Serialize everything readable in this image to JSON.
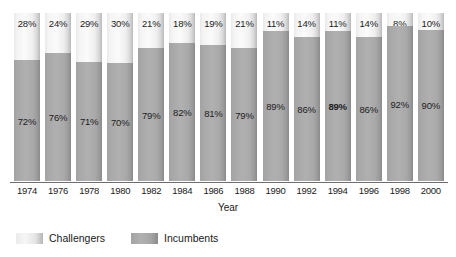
{
  "chart_data": {
    "type": "bar",
    "stacked": true,
    "stack_mode": "percent",
    "title": "",
    "subtitle": "",
    "xlabel": "Year",
    "ylabel": "",
    "ylim": [
      0,
      100
    ],
    "grid": false,
    "legend_position": "bottom-left",
    "categories": [
      "1974",
      "1976",
      "1978",
      "1980",
      "1982",
      "1984",
      "1986",
      "1988",
      "1990",
      "1992",
      "1994",
      "1996",
      "1998",
      "2000"
    ],
    "series": [
      {
        "name": "Challengers",
        "color": "#f2f2f2",
        "values": [
          28,
          24,
          29,
          30,
          21,
          18,
          19,
          21,
          11,
          14,
          11,
          14,
          8,
          10
        ],
        "labels": [
          "28%",
          "24%",
          "29%",
          "30%",
          "21%",
          "18%",
          "19%",
          "21%",
          "11%",
          "14%",
          "11%",
          "14%",
          "8%",
          "10%"
        ]
      },
      {
        "name": "Incumbents",
        "color": "#ababab",
        "values": [
          72,
          76,
          71,
          70,
          79,
          82,
          81,
          79,
          89,
          86,
          89,
          86,
          92,
          90
        ],
        "labels": [
          "72%",
          "76%",
          "71%",
          "70%",
          "79%",
          "82%",
          "81%",
          "79%",
          "89%",
          "86%",
          "89%",
          "86%",
          "92%",
          "90%"
        ],
        "bold_label_indices": [
          10
        ]
      }
    ]
  },
  "legend": {
    "items": [
      {
        "label": "Challengers",
        "swatch": "challengers-swatch"
      },
      {
        "label": "Incumbents",
        "swatch": "incumbents-swatch"
      }
    ]
  },
  "axis": {
    "x_title": "Year"
  }
}
